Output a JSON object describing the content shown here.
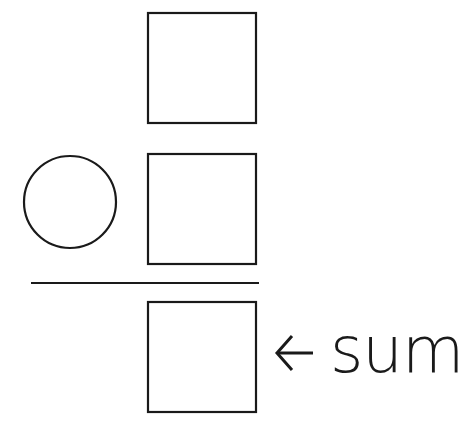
{
  "diagram": {
    "type": "addition-worksheet",
    "stroke_color": "#1a1a1a",
    "background": "#ffffff",
    "boxes": [
      {
        "id": "addend-top",
        "x": 148,
        "y": 13,
        "w": 108,
        "h": 110
      },
      {
        "id": "addend-bottom",
        "x": 148,
        "y": 154,
        "w": 108,
        "h": 110
      },
      {
        "id": "sum-box",
        "x": 148,
        "y": 302,
        "w": 108,
        "h": 110
      }
    ],
    "operator_circle": {
      "cx": 70,
      "cy": 202,
      "r": 46
    },
    "sum_line": {
      "x1": 31,
      "x2": 259,
      "y": 283
    },
    "sum_label": {
      "arrow": "←",
      "text": "sum"
    }
  }
}
